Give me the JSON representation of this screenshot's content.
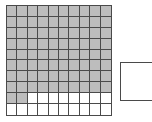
{
  "diagram": {
    "grid": {
      "label": "ten-by-ten-grid",
      "rows": 10,
      "columns": 10,
      "total_cells": 100,
      "shaded_cells": 82,
      "unshaded_cells": 18,
      "fill_color": "#bdbdbd",
      "empty_color": "#ffffff",
      "line_color": "#4a4a4a",
      "shaded_per_row": [
        10,
        10,
        10,
        10,
        10,
        10,
        10,
        10,
        2,
        0
      ],
      "cells": [
        [
          1,
          1,
          1,
          1,
          1,
          1,
          1,
          1,
          1,
          1
        ],
        [
          1,
          1,
          1,
          1,
          1,
          1,
          1,
          1,
          1,
          1
        ],
        [
          1,
          1,
          1,
          1,
          1,
          1,
          1,
          1,
          1,
          1
        ],
        [
          1,
          1,
          1,
          1,
          1,
          1,
          1,
          1,
          1,
          1
        ],
        [
          1,
          1,
          1,
          1,
          1,
          1,
          1,
          1,
          1,
          1
        ],
        [
          1,
          1,
          1,
          1,
          1,
          1,
          1,
          1,
          1,
          1
        ],
        [
          1,
          1,
          1,
          1,
          1,
          1,
          1,
          1,
          1,
          1
        ],
        [
          1,
          1,
          1,
          1,
          1,
          1,
          1,
          1,
          1,
          1
        ],
        [
          1,
          1,
          0,
          0,
          0,
          0,
          0,
          0,
          0,
          0
        ],
        [
          0,
          0,
          0,
          0,
          0,
          0,
          0,
          0,
          0,
          0
        ]
      ]
    },
    "side_box": {
      "label": "empty-answer-box",
      "text": "",
      "border_color": "#4a4a4a",
      "fill_color": "#ffffff"
    }
  }
}
